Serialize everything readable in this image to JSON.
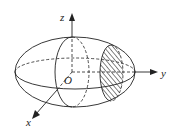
{
  "diagram": {
    "type": "ellipsoid-with-axes",
    "axes": {
      "z_label": "z",
      "y_label": "y",
      "x_label": "x",
      "origin_label": "O"
    },
    "features": [
      "ellipsoid surface",
      "xz cross-section ellipse",
      "xy equator ellipse",
      "hatched cross-section perpendicular to y-axis"
    ],
    "colors": {
      "stroke": "#222222",
      "background": "#ffffff"
    }
  }
}
